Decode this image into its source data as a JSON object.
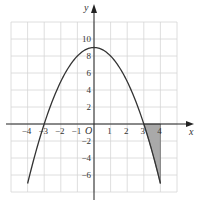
{
  "chart_data": {
    "type": "line",
    "title": "",
    "function": "y = 9 - x^2",
    "xlabel": "x",
    "ylabel": "y",
    "origin_label": "O",
    "xlim": [
      -5,
      5
    ],
    "ylim": [
      -8,
      12
    ],
    "grid": true,
    "x_ticks": [
      -4,
      -3,
      -2,
      -1,
      1,
      2,
      3,
      4
    ],
    "x_tick_labels": [
      "−4",
      "−3",
      "−2",
      "−1",
      "1",
      "2",
      "3",
      "4"
    ],
    "y_ticks": [
      10,
      8,
      6,
      4,
      2,
      -2,
      -4,
      -6
    ],
    "y_tick_labels": [
      "10",
      "8",
      "6",
      "4",
      "2",
      "−2",
      "−4",
      "−6"
    ],
    "series": [
      {
        "name": "y = 9 - x^2",
        "x": [
          -4,
          -3,
          -2,
          -1,
          0,
          1,
          2,
          3,
          4
        ],
        "values": [
          -7,
          0,
          5,
          8,
          9,
          8,
          5,
          0,
          -7
        ]
      }
    ],
    "shaded_region": {
      "description": "Area between curve and x-axis from x = 3 to x = 4 (below x-axis)",
      "x_from": 3,
      "x_to": 4,
      "color": "#a9a9a9"
    },
    "colors": {
      "curve": "#333333",
      "grid": "#d6d6d6",
      "axis": "#222222",
      "shade": "#a9a9a9"
    }
  }
}
